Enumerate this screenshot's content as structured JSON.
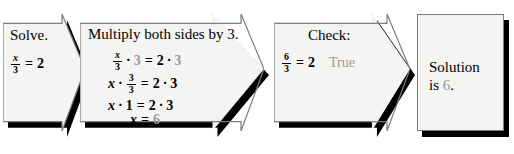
{
  "diagram": {
    "type": "flowchart",
    "orientation": "left-to-right",
    "panel_count": 4
  },
  "colors": {
    "page_background": "#ffffff",
    "panel_fill": "#f4f4f2",
    "panel_border": "#8a8a8a",
    "shadow": "#000000",
    "text": "#000000",
    "emphasis_gray": "#9a9a9a"
  },
  "steps": [
    {
      "id": "step-solve",
      "shape": "arrow",
      "heading": "Solve.",
      "equation": {
        "numerator": "x",
        "denominator": "3",
        "relation": "=",
        "right": "2"
      }
    },
    {
      "id": "step-multiply",
      "shape": "arrow",
      "heading": "Multiply both sides by 3.",
      "lines": [
        {
          "left_fraction": {
            "numerator": "x",
            "denominator": "3"
          },
          "left_operator": "·",
          "left_factor": "3",
          "left_factor_emphasis": "gray",
          "relation": "=",
          "right_first": "2",
          "right_operator": "·",
          "right_second": "3",
          "right_second_emphasis": "gray"
        },
        {
          "left_variable": "x",
          "left_operator": "·",
          "left_fraction": {
            "numerator": "3",
            "denominator": "3"
          },
          "relation": "=",
          "right_first": "2",
          "right_operator": "·",
          "right_second": "3"
        },
        {
          "left_variable": "x",
          "left_operator": "·",
          "left_factor": "1",
          "relation": "=",
          "right_first": "2",
          "right_operator": "·",
          "right_second": "3"
        },
        {
          "left_variable": "x",
          "relation": "=",
          "right_first": "6",
          "right_first_emphasis": "gray"
        }
      ]
    },
    {
      "id": "step-check",
      "shape": "arrow",
      "heading": "Check:",
      "equation": {
        "numerator": "6",
        "denominator": "3",
        "relation": "=",
        "right": "2"
      },
      "verdict": "True",
      "verdict_emphasis": "gray"
    },
    {
      "id": "step-solution",
      "shape": "rectangle",
      "text_line_1": "Solution",
      "text_line_2_prefix": "is ",
      "text_line_2_value": "6",
      "text_line_2_suffix": ".",
      "value_emphasis": "gray"
    }
  ]
}
